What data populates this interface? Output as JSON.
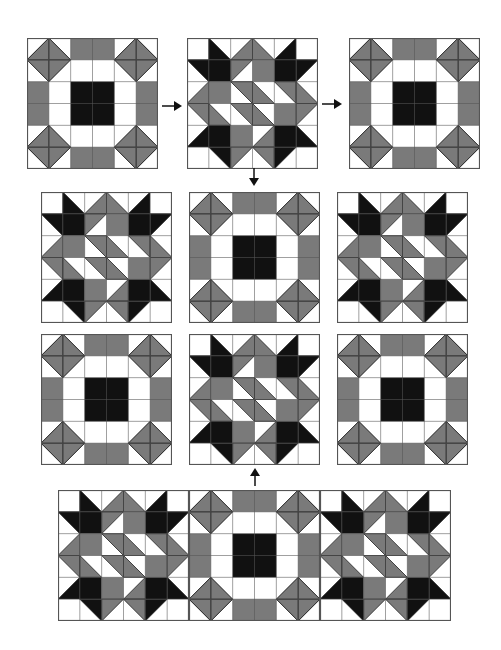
{
  "colors": {
    "gray": "#7a7a7a",
    "black": "#111111",
    "white": "#ffffff",
    "line": "#555555"
  },
  "blocks": [
    {
      "type": "A",
      "x": 27,
      "y": 38,
      "size": 131
    },
    {
      "type": "B",
      "x": 187,
      "y": 38,
      "size": 131
    },
    {
      "type": "C",
      "x": 349,
      "y": 38,
      "size": 131
    },
    {
      "type": "B",
      "x": 41,
      "y": 192,
      "size": 131
    },
    {
      "type": "A",
      "x": 189,
      "y": 192,
      "size": 131
    },
    {
      "type": "B",
      "x": 337,
      "y": 192,
      "size": 131
    },
    {
      "type": "A",
      "x": 41,
      "y": 334,
      "size": 131
    },
    {
      "type": "B",
      "x": 189,
      "y": 334,
      "size": 131
    },
    {
      "type": "A",
      "x": 337,
      "y": 334,
      "size": 131
    },
    {
      "type": "B",
      "x": 58,
      "y": 490,
      "size": 131
    },
    {
      "type": "A",
      "x": 189,
      "y": 490,
      "size": 131
    },
    {
      "type": "B",
      "x": 320,
      "y": 490,
      "size": 131
    }
  ],
  "arrows": [
    {
      "dir": "right",
      "x": 162,
      "y": 102,
      "len": 20
    },
    {
      "dir": "right",
      "x": 322,
      "y": 100,
      "len": 20
    },
    {
      "dir": "down",
      "x": 254,
      "y": 168,
      "len": 18
    },
    {
      "dir": "up",
      "x": 255,
      "y": 468,
      "len": 18
    }
  ],
  "star_pattern": [
    [
      [
        "W"
      ],
      [
        "TLBR",
        "LL",
        "K"
      ],
      [
        "BLTR",
        "LR",
        "G"
      ],
      [
        "TLBR",
        "LL",
        "G"
      ],
      [
        "BLTR",
        "LR",
        "K"
      ],
      [
        "W"
      ]
    ],
    [
      [
        "TLBR",
        "UR",
        "K"
      ],
      [
        "K"
      ],
      [
        "BLTR",
        "UL",
        "G"
      ],
      [
        "G"
      ],
      [
        "K"
      ],
      [
        "BLTR",
        "UL",
        "K"
      ]
    ],
    [
      [
        "BLTR",
        "LR",
        "G"
      ],
      [
        "G"
      ],
      [
        "TLBR",
        "UR",
        "G"
      ],
      [
        "BLTR",
        "LL",
        "G"
      ],
      [
        "TLBR",
        "UR",
        "G"
      ],
      [
        "TLBR",
        "LL",
        "G"
      ]
    ],
    [
      [
        "TLBR",
        "UR",
        "G"
      ],
      [
        "TLBR",
        "LL",
        "G"
      ],
      [
        "BLTR",
        "UR",
        "G"
      ],
      [
        "TLBR",
        "LL",
        "G"
      ],
      [
        "G"
      ],
      [
        "BLTR",
        "UL",
        "G"
      ]
    ],
    [
      [
        "BLTR",
        "LR",
        "K"
      ],
      [
        "K"
      ],
      [
        "G"
      ],
      [
        "BLTR",
        "LR",
        "G"
      ],
      [
        "K"
      ],
      [
        "TLBR",
        "LL",
        "K"
      ]
    ],
    [
      [
        "W"
      ],
      [
        "TLBR",
        "UR",
        "K"
      ],
      [
        "BLTR",
        "UL",
        "G"
      ],
      [
        "TLBR",
        "UR",
        "G"
      ],
      [
        "BLTR",
        "UL",
        "K"
      ],
      [
        "W"
      ]
    ]
  ]
}
